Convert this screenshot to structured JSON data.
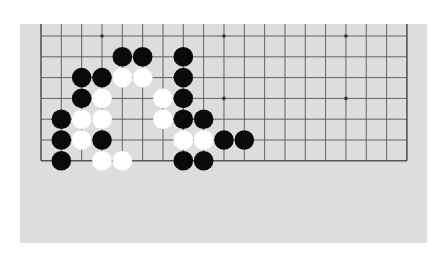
{
  "board": {
    "size": 19,
    "visible_cols": [
      0,
      18
    ],
    "visible_rows": [
      12,
      18
    ],
    "colors": {
      "background": "#dddddd",
      "line": "#555555",
      "black_stone": "#0a0a0a",
      "white_stone": "#ffffff"
    },
    "star_points": [
      {
        "col": 3,
        "row": 12
      },
      {
        "col": 9,
        "row": 12
      },
      {
        "col": 15,
        "row": 12
      },
      {
        "col": 3,
        "row": 15
      },
      {
        "col": 9,
        "row": 15
      },
      {
        "col": 15,
        "row": 15
      }
    ],
    "stones": [
      {
        "color": "black",
        "col": 4,
        "row": 13
      },
      {
        "color": "black",
        "col": 5,
        "row": 13
      },
      {
        "color": "black",
        "col": 7,
        "row": 13
      },
      {
        "color": "black",
        "col": 2,
        "row": 14
      },
      {
        "color": "black",
        "col": 3,
        "row": 14
      },
      {
        "color": "white",
        "col": 4,
        "row": 14
      },
      {
        "color": "white",
        "col": 5,
        "row": 14
      },
      {
        "color": "black",
        "col": 7,
        "row": 14
      },
      {
        "color": "black",
        "col": 2,
        "row": 15
      },
      {
        "color": "white",
        "col": 3,
        "row": 15
      },
      {
        "color": "white",
        "col": 6,
        "row": 15
      },
      {
        "color": "black",
        "col": 7,
        "row": 15
      },
      {
        "color": "black",
        "col": 1,
        "row": 16
      },
      {
        "color": "white",
        "col": 2,
        "row": 16
      },
      {
        "color": "white",
        "col": 3,
        "row": 16
      },
      {
        "color": "white",
        "col": 6,
        "row": 16
      },
      {
        "color": "black",
        "col": 7,
        "row": 16
      },
      {
        "color": "black",
        "col": 8,
        "row": 16
      },
      {
        "color": "black",
        "col": 1,
        "row": 17
      },
      {
        "color": "white",
        "col": 2,
        "row": 17
      },
      {
        "color": "black",
        "col": 3,
        "row": 17
      },
      {
        "color": "white",
        "col": 7,
        "row": 17
      },
      {
        "color": "white",
        "col": 8,
        "row": 17
      },
      {
        "color": "black",
        "col": 9,
        "row": 17
      },
      {
        "color": "black",
        "col": 10,
        "row": 17
      },
      {
        "color": "black",
        "col": 1,
        "row": 18
      },
      {
        "color": "white",
        "col": 3,
        "row": 18
      },
      {
        "color": "white",
        "col": 4,
        "row": 18
      },
      {
        "color": "black",
        "col": 7,
        "row": 18
      },
      {
        "color": "black",
        "col": 8,
        "row": 18
      }
    ]
  }
}
